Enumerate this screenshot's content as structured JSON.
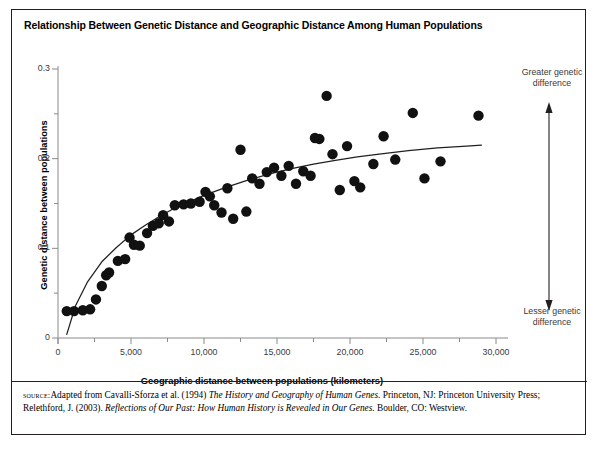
{
  "figure": {
    "title": "Relationship Between Genetic Distance and Geographic Distance Among Human Populations",
    "source_label": "source:",
    "source_text_1": "Adapted from Cavalli-Sforza et al. (1994) ",
    "source_italic_1": "The History and Geography of Human Genes",
    "source_text_2": ". Princeton, NJ: Princeton University Press; Relethford, J. (2003). ",
    "source_italic_2": "Reflections of Our Past: How Human History is Revealed in Our Genes",
    "source_text_3": ". Boulder, CO: Westview."
  },
  "annotations": {
    "top": "Greater genetic difference",
    "bottom": "Lesser genetic difference",
    "arrow_name": "double-headed-vertical-arrow"
  },
  "chart_data": {
    "type": "scatter",
    "title": "Relationship Between Genetic Distance and Geographic Distance Among Human Populations",
    "xlabel": "Geographic distance between populations (kilometers)",
    "ylabel": "Genetic distance between populations",
    "xlim": [
      0,
      30000
    ],
    "ylim": [
      0,
      0.3
    ],
    "grid": false,
    "legend": "none",
    "xticks": [
      0,
      5000,
      10000,
      15000,
      20000,
      25000,
      30000
    ],
    "xtick_labels": [
      "0",
      "5,000",
      "10,000",
      "15,000",
      "20,000",
      "25,000",
      "30,000"
    ],
    "xminor_step": 2500,
    "yticks": [
      0,
      0.1,
      0.2,
      0.3
    ],
    "ytick_labels": [
      "0",
      "0.1",
      "0.2",
      "0.3"
    ],
    "yminor_step": 0.05,
    "marker": "filled-circle",
    "marker_color": "#111111",
    "marker_size": 5.2,
    "points": [
      [
        600,
        0.03
      ],
      [
        1100,
        0.03
      ],
      [
        1700,
        0.031
      ],
      [
        2200,
        0.032
      ],
      [
        2600,
        0.043
      ],
      [
        3000,
        0.058
      ],
      [
        3300,
        0.07
      ],
      [
        3500,
        0.073
      ],
      [
        4100,
        0.086
      ],
      [
        4600,
        0.088
      ],
      [
        4900,
        0.112
      ],
      [
        5200,
        0.104
      ],
      [
        5600,
        0.103
      ],
      [
        6100,
        0.117
      ],
      [
        6500,
        0.125
      ],
      [
        6900,
        0.128
      ],
      [
        7200,
        0.137
      ],
      [
        7600,
        0.13
      ],
      [
        8000,
        0.148
      ],
      [
        8600,
        0.149
      ],
      [
        9100,
        0.15
      ],
      [
        9700,
        0.152
      ],
      [
        10100,
        0.163
      ],
      [
        10400,
        0.158
      ],
      [
        10700,
        0.148
      ],
      [
        11200,
        0.14
      ],
      [
        11600,
        0.167
      ],
      [
        12000,
        0.133
      ],
      [
        12500,
        0.21
      ],
      [
        12900,
        0.141
      ],
      [
        13300,
        0.178
      ],
      [
        13800,
        0.172
      ],
      [
        14300,
        0.185
      ],
      [
        14800,
        0.19
      ],
      [
        15300,
        0.181
      ],
      [
        15800,
        0.192
      ],
      [
        16300,
        0.172
      ],
      [
        16800,
        0.186
      ],
      [
        17300,
        0.181
      ],
      [
        17600,
        0.223
      ],
      [
        17900,
        0.222
      ],
      [
        18400,
        0.27
      ],
      [
        18800,
        0.205
      ],
      [
        19300,
        0.165
      ],
      [
        19800,
        0.214
      ],
      [
        20300,
        0.175
      ],
      [
        20700,
        0.168
      ],
      [
        21600,
        0.194
      ],
      [
        22300,
        0.225
      ],
      [
        23100,
        0.199
      ],
      [
        24300,
        0.251
      ],
      [
        25100,
        0.178
      ],
      [
        26200,
        0.197
      ],
      [
        28800,
        0.248
      ]
    ],
    "trend": {
      "type": "logarithmic-fit-curve",
      "color": "#231f20",
      "points": [
        [
          600,
          0.004
        ],
        [
          1200,
          0.036
        ],
        [
          2000,
          0.062
        ],
        [
          3000,
          0.085
        ],
        [
          4000,
          0.101
        ],
        [
          5000,
          0.115
        ],
        [
          6000,
          0.126
        ],
        [
          7000,
          0.136
        ],
        [
          8000,
          0.145
        ],
        [
          9000,
          0.152
        ],
        [
          10000,
          0.159
        ],
        [
          11500,
          0.168
        ],
        [
          13000,
          0.176
        ],
        [
          14500,
          0.183
        ],
        [
          16000,
          0.189
        ],
        [
          17500,
          0.194
        ],
        [
          19000,
          0.198
        ],
        [
          20500,
          0.202
        ],
        [
          22000,
          0.205
        ],
        [
          24000,
          0.209
        ],
        [
          26000,
          0.212
        ],
        [
          28000,
          0.214
        ],
        [
          29000,
          0.215
        ]
      ]
    }
  }
}
